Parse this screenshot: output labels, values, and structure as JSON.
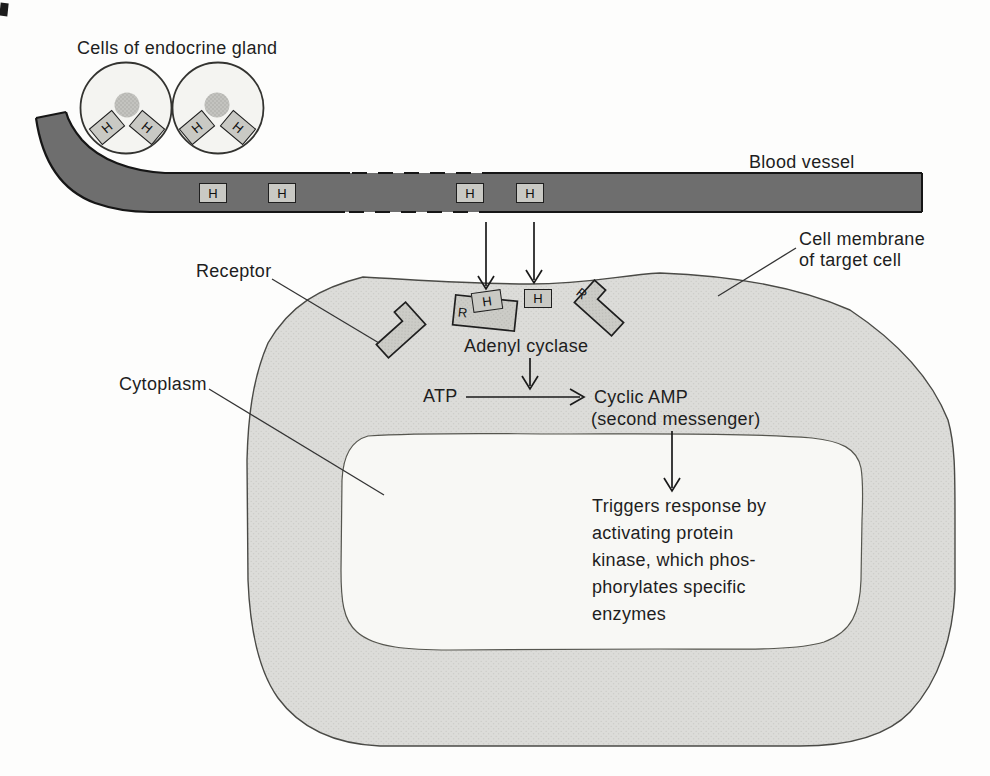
{
  "labels": {
    "endocrine_gland": "Cells of endocrine gland",
    "blood_vessel": "Blood vessel",
    "cell_membrane": [
      "Cell membrane",
      "of target cell"
    ],
    "receptor": "Receptor",
    "adenyl_cyclase": "Adenyl cyclase",
    "cytoplasm": "Cytoplasm"
  },
  "reaction": {
    "substrate": "ATP",
    "product": "Cyclic AMP",
    "product_note": "(second messenger)"
  },
  "response": {
    "lines": [
      "Triggers response by",
      "activating protein",
      "kinase, which phos-",
      "phorylates specific",
      "enzymes"
    ]
  },
  "molecules": {
    "hormone": "H",
    "receptor_abbr": "R"
  },
  "colors": {
    "vessel_fill": "#6e6e6e",
    "outline": "#1c1c1c",
    "membrane_fill": "#dcdcd9",
    "cytoplasm_fill": "#f8f8f5",
    "gland_cell_fill": "#f4f4f1",
    "nucleus_fill": "#bcbcb8",
    "hormone_box_fill": "#c9c9c4",
    "receptor_fill": "#ccccc7"
  }
}
